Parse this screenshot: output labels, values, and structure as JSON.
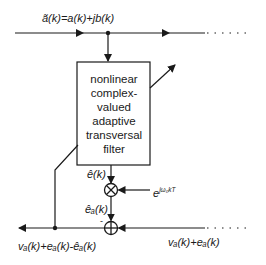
{
  "diagram": {
    "input_label": "ã(k)=a(k)+jb(k)",
    "filter": {
      "lines": [
        "nonlinear",
        "complex-",
        "valued",
        "adaptive",
        "transversal",
        "filter"
      ]
    },
    "filter_output_label": "ê(k)",
    "multiplier_input_label": "e",
    "multiplier_input_exponent": "jω₀kT",
    "shifted_output_label": "êₐ(k)",
    "sum_sign": "-",
    "right_input_label": "vₐ(k)+eₐ(k)",
    "output_label": "vₐ(k)+eₐ(k)-êₐ(k)",
    "colors": {
      "line": "#1a1a1a",
      "background": "#ffffff"
    }
  }
}
